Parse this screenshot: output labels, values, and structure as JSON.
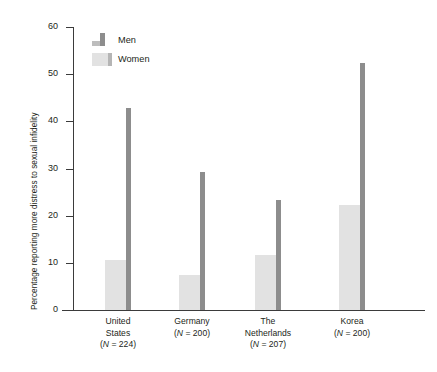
{
  "chart_data": {
    "type": "bar",
    "title": "",
    "xlabel": "",
    "ylabel": "Percentage reporting more distress to sexual infidelity",
    "ylim": [
      0,
      60
    ],
    "yticks": [
      0,
      10,
      20,
      30,
      40,
      50,
      60
    ],
    "grid": false,
    "legend_position": "top-left",
    "categories": [
      "United States",
      "Germany",
      "The Netherlands",
      "Korea"
    ],
    "category_lines": [
      [
        "United",
        "States",
        "(N = 224)"
      ],
      [
        "Germany",
        "(N = 200)"
      ],
      [
        "The",
        "Netherlands",
        "(N = 207)"
      ],
      [
        "Korea",
        "(N = 200)"
      ]
    ],
    "sample_sizes": [
      224,
      200,
      207,
      200
    ],
    "series": [
      {
        "name": "Men",
        "color": "#8d8d8d",
        "values": [
          42.8,
          29.3,
          23.4,
          52.4
        ]
      },
      {
        "name": "Women",
        "color": "#e2e2e2",
        "values": [
          10.5,
          7.5,
          11.6,
          22.3
        ]
      }
    ]
  },
  "legend": {
    "items": [
      {
        "label": "Men",
        "swatch": "men-swatch-icon"
      },
      {
        "label": "Women",
        "swatch": "women-swatch-icon"
      }
    ]
  },
  "axis": {
    "y_title": "Percentage reporting more distress to sexual infidelity",
    "y_tick_labels": [
      "60",
      "50",
      "40",
      "30",
      "20",
      "10",
      "0"
    ]
  }
}
